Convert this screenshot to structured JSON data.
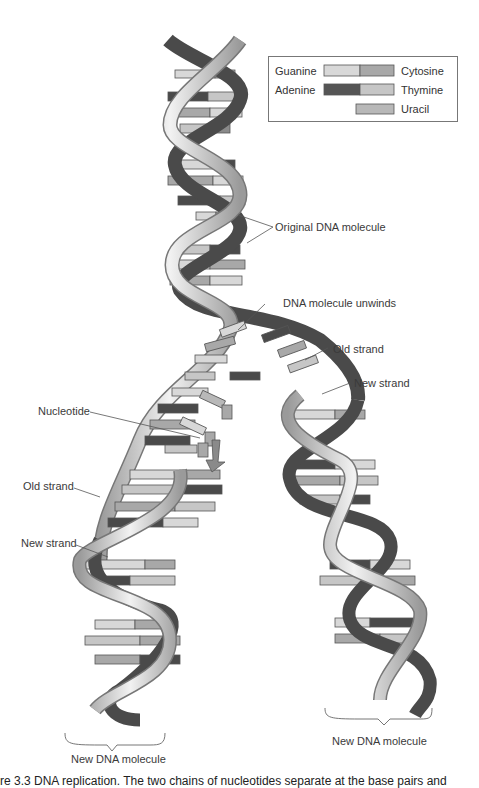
{
  "legend": {
    "items": [
      {
        "left": "Guanine",
        "right": "Cytosine",
        "left_color": "#d8d8d8",
        "right_color": "#a8a8a8"
      },
      {
        "left": "Adenine",
        "right": "Thymine",
        "left_color": "#555555",
        "right_color": "#c6c6c6"
      },
      {
        "left": "",
        "right": "Uracil",
        "right_color": "#b8b8b8"
      }
    ]
  },
  "labels": {
    "original": "Original DNA molecule",
    "unwinds": "DNA molecule unwinds",
    "old_strand_right": "Old strand",
    "new_strand_right": "New strand",
    "nucleotide": "Nucleotide",
    "old_strand_left": "Old strand",
    "new_strand_left": "New strand",
    "new_molecule_left": "New DNA molecule",
    "new_molecule_right": "New DNA molecule"
  },
  "caption": "re 3.3 DNA replication. The two chains of nucleotides separate at the base pairs and",
  "colors": {
    "backbone_light": "#c9c9c9",
    "backbone_dark": "#4a4a4a",
    "outline": "#555555"
  }
}
